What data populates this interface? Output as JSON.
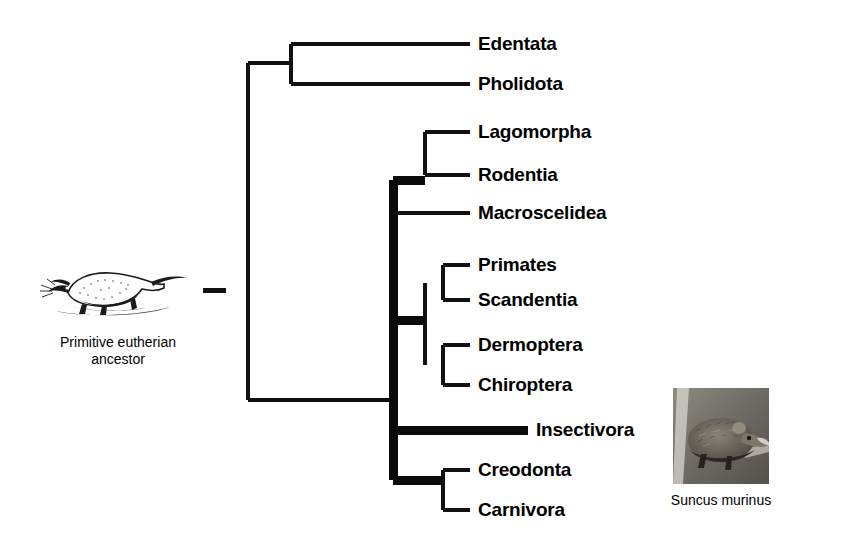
{
  "figure": {
    "type": "phylogenetic-cladogram"
  },
  "ancestor": {
    "caption_line1": "Primitive eutherian",
    "caption_line2": "ancestor",
    "icon": "shrew-illustration",
    "branch_mark": "root-stub-dash"
  },
  "photo": {
    "caption": "Suncus murinus",
    "icon": "shrew-photograph"
  },
  "taxa": [
    {
      "id": "edentata",
      "label": "Edentata",
      "x": 478,
      "y": 44,
      "tip_x": 470,
      "stem_x": 291,
      "weight": "thin"
    },
    {
      "id": "pholidota",
      "label": "Pholidota",
      "x": 478,
      "y": 84,
      "tip_x": 470,
      "stem_x": 291,
      "weight": "thin"
    },
    {
      "id": "lagomorpha",
      "label": "Lagomorpha",
      "x": 478,
      "y": 132,
      "tip_x": 470,
      "stem_x": 425,
      "weight": "thin"
    },
    {
      "id": "rodentia",
      "label": "Rodentia",
      "x": 478,
      "y": 175,
      "tip_x": 470,
      "stem_x": 425,
      "weight": "thin"
    },
    {
      "id": "macroscelidea",
      "label": "Macroscelidea",
      "x": 478,
      "y": 213,
      "tip_x": 470,
      "stem_x": 393,
      "weight": "thin"
    },
    {
      "id": "primates",
      "label": "Primates",
      "x": 478,
      "y": 265,
      "tip_x": 470,
      "stem_x": 443,
      "weight": "thin"
    },
    {
      "id": "scandentia",
      "label": "Scandentia",
      "x": 478,
      "y": 300,
      "tip_x": 470,
      "stem_x": 443,
      "weight": "thin"
    },
    {
      "id": "dermoptera",
      "label": "Dermoptera",
      "x": 478,
      "y": 345,
      "tip_x": 470,
      "stem_x": 443,
      "weight": "thin"
    },
    {
      "id": "chiroptera",
      "label": "Chiroptera",
      "x": 478,
      "y": 385,
      "tip_x": 470,
      "stem_x": 443,
      "weight": "thin"
    },
    {
      "id": "insectivora",
      "label": "Insectivora",
      "x": 536,
      "y": 430,
      "tip_x": 528,
      "stem_x": 393,
      "weight": "thick"
    },
    {
      "id": "creodonta",
      "label": "Creodonta",
      "x": 478,
      "y": 470,
      "tip_x": 470,
      "stem_x": 443,
      "weight": "thin"
    },
    {
      "id": "carnivora",
      "label": "Carnivora",
      "x": 478,
      "y": 510,
      "tip_x": 470,
      "stem_x": 443,
      "weight": "thin"
    }
  ],
  "nodes": [
    {
      "id": "root-trunk",
      "orientation": "vertical",
      "x": 248,
      "y1": 63,
      "y2": 400,
      "weight": "thin"
    },
    {
      "id": "root-stem",
      "orientation": "horizontal",
      "y": 400,
      "x1": 248,
      "x2": 393,
      "weight": "thin"
    },
    {
      "id": "xenarthra-node",
      "orientation": "vertical",
      "x": 291,
      "y1": 44,
      "y2": 84,
      "weight": "thin"
    },
    {
      "id": "xenarthra-stem",
      "orientation": "horizontal",
      "y": 63,
      "x1": 248,
      "x2": 291,
      "weight": "thin"
    },
    {
      "id": "main-trunk",
      "orientation": "vertical",
      "x": 393,
      "y1": 180,
      "y2": 480,
      "weight": "thick"
    },
    {
      "id": "glires-node",
      "orientation": "vertical",
      "x": 425,
      "y1": 132,
      "y2": 175,
      "weight": "thin"
    },
    {
      "id": "glires-stem",
      "orientation": "horizontal",
      "y": 180,
      "x1": 393,
      "x2": 425,
      "weight": "thick"
    },
    {
      "id": "euarchonta-trunk",
      "orientation": "vertical",
      "x": 425,
      "y1": 283,
      "y2": 365,
      "weight": "thin"
    },
    {
      "id": "euarchonta-stem",
      "orientation": "horizontal",
      "y": 320,
      "x1": 393,
      "x2": 425,
      "weight": "thick"
    },
    {
      "id": "primatomorpha",
      "orientation": "vertical",
      "x": 443,
      "y1": 265,
      "y2": 300,
      "weight": "thin"
    },
    {
      "id": "chiropteran-node",
      "orientation": "vertical",
      "x": 443,
      "y1": 345,
      "y2": 385,
      "weight": "thin"
    },
    {
      "id": "ferae-node",
      "orientation": "vertical",
      "x": 443,
      "y1": 470,
      "y2": 510,
      "weight": "thin"
    },
    {
      "id": "ferae-stem",
      "orientation": "horizontal",
      "y": 480,
      "x1": 393,
      "x2": 443,
      "weight": "thick"
    }
  ],
  "colors": {
    "line": "#111111",
    "text": "#000000",
    "background": "#ffffff"
  }
}
